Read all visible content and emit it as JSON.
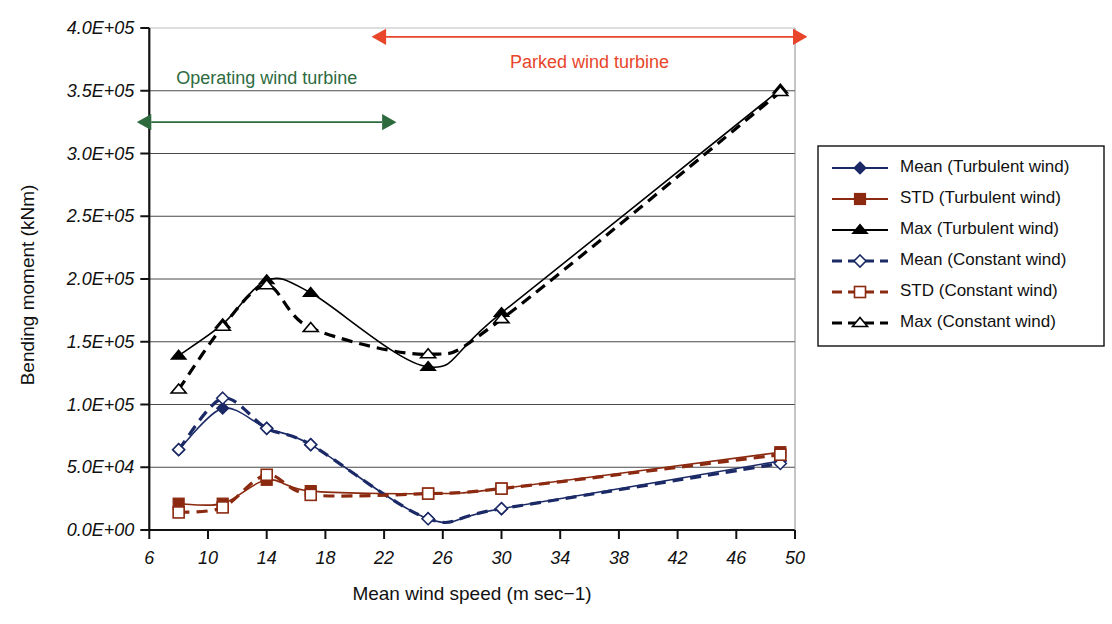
{
  "chart_data": {
    "type": "line",
    "title": "",
    "xlabel": "Mean wind speed (m sec−1)",
    "ylabel": "Bending moment (kNm)",
    "xlim": [
      6,
      50
    ],
    "ylim": [
      0,
      400000
    ],
    "xticks": [
      6,
      10,
      14,
      18,
      22,
      26,
      30,
      34,
      38,
      42,
      46,
      50
    ],
    "xticklabels": [
      "6",
      "10",
      "14",
      "18",
      "22",
      "26",
      "30",
      "34",
      "38",
      "42",
      "46",
      "50"
    ],
    "yticks": [
      0,
      50000,
      100000,
      150000,
      200000,
      250000,
      300000,
      350000,
      400000
    ],
    "yticklabels": [
      "0.0E+00",
      "5.0E+04",
      "1.0E+05",
      "1.5E+05",
      "2.0E+05",
      "2.5E+05",
      "3.0E+05",
      "3.5E+05",
      "4.0E+05"
    ],
    "grid": "horizontal",
    "legend_position": "right",
    "x": [
      8,
      11,
      14,
      17,
      25,
      30,
      49
    ],
    "series": [
      {
        "name": "Mean (Turbulent wind)",
        "marker": "diamond-filled",
        "line": "solid",
        "color": "#1b2a66",
        "values": [
          64000,
          97000,
          81000,
          68000,
          9000,
          17000,
          55000
        ]
      },
      {
        "name": "STD (Turbulent wind)",
        "marker": "square-filled",
        "line": "solid",
        "color": "#8b2a10",
        "values": [
          21000,
          21000,
          40000,
          31000,
          29000,
          33000,
          62000
        ]
      },
      {
        "name": "Max (Turbulent wind)",
        "marker": "triangle-filled",
        "line": "solid",
        "color": "#000000",
        "values": [
          139000,
          164000,
          199000,
          189000,
          130000,
          173000,
          351000
        ]
      },
      {
        "name": "Mean (Constant wind)",
        "marker": "diamond-open",
        "line": "dashed",
        "color": "#1b2a66",
        "values": [
          64000,
          105000,
          81000,
          68000,
          9000,
          17000,
          53000
        ]
      },
      {
        "name": "STD (Constant wind)",
        "marker": "square-open",
        "line": "dashed",
        "color": "#8b2a10",
        "values": [
          14000,
          18000,
          44000,
          28000,
          29000,
          33000,
          60000
        ]
      },
      {
        "name": "Max (Constant wind)",
        "marker": "triangle-open",
        "line": "dashed",
        "color": "#000000",
        "values": [
          112000,
          162000,
          195000,
          161000,
          140000,
          168000,
          349000
        ]
      }
    ],
    "annotations": [
      {
        "id": "operating",
        "label": "Operating wind turbine",
        "color": "#2d6b3f",
        "x_from": 6,
        "x_to": 22,
        "y": 325000,
        "label_y": 355000,
        "arrow": "double"
      },
      {
        "id": "parked",
        "label": "Parked wind turbine",
        "color": "#e8452a",
        "x_from": 22,
        "x_to": 50,
        "y": 393000,
        "label_y": 368000,
        "arrow": "double"
      }
    ]
  }
}
